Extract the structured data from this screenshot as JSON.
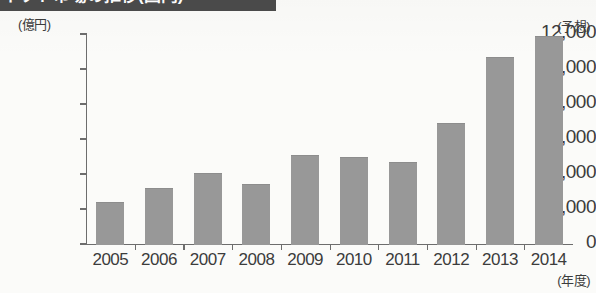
{
  "title": {
    "text": "ネット市場の推移(国内)",
    "clipped": true
  },
  "unit_label": "(億円)",
  "forecast_annotation": "(予想)",
  "xaxis_unit_label": "(年度)",
  "colors": {
    "bar_fill": "#989898",
    "axis": "#6d6d6d",
    "text": "#3c3c3c",
    "background": "#fbfbf9",
    "title_band": "#4b4b4b"
  },
  "chart_data": {
    "type": "bar",
    "title": "ネット市場の推移(国内)",
    "xlabel": "(年度)",
    "ylabel": "(億円)",
    "ylim": [
      0,
      12000
    ],
    "ytick_values": [
      0,
      2000,
      4000,
      6000,
      8000,
      10000,
      12000
    ],
    "ytick_labels": [
      "0",
      "2,000",
      "4,000",
      "6,000",
      "8,000",
      "10,000",
      "12,000"
    ],
    "grid": false,
    "legend": "none",
    "categories": [
      "2005",
      "2006",
      "2007",
      "2008",
      "2009",
      "2010",
      "2011",
      "2012",
      "2013",
      "2014"
    ],
    "values": [
      2400,
      3200,
      4050,
      3450,
      5100,
      5000,
      4700,
      6900,
      10700,
      11900
    ],
    "annotations": [
      {
        "target_category": "2014",
        "text": "(予想)",
        "meaning": "forecast"
      }
    ]
  }
}
